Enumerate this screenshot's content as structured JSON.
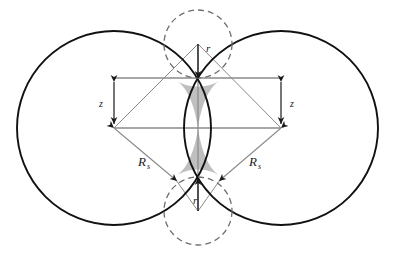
{
  "figure": {
    "background_color": "#ffffff",
    "width": 397,
    "height": 261,
    "colors": {
      "solid_outline": "#111111",
      "dashed_outline": "#6e6e6e",
      "dimension_line": "#8a8a8a",
      "leader_line": "#8a8a8a",
      "neck_fill": "#bfbfbf",
      "label_text": "#1a1a1a"
    },
    "shapes": {
      "left_sphere": {
        "name": "left-sphere",
        "style": "solid",
        "cx": 114,
        "cy": 128,
        "r": 97
      },
      "right_sphere": {
        "name": "right-sphere",
        "style": "solid",
        "cx": 281,
        "cy": 128,
        "r": 97
      },
      "top_meniscus_circle": {
        "name": "top-meniscus-circle",
        "style": "dashed",
        "cx": 198,
        "cy": 44,
        "r": 34
      },
      "bottom_meniscus_circle": {
        "name": "bottom-meniscus-circle",
        "style": "dashed",
        "cx": 198,
        "cy": 211,
        "r": 34
      },
      "neck_region": {
        "name": "neck-region",
        "fill": "#bfbfbf",
        "description": "shaded hourglass liquid bridge between the two spheres"
      }
    },
    "labels": [
      {
        "id": "r_top",
        "text": "r",
        "sub": "",
        "x": 206,
        "y": 50,
        "describes": "meniscus radius, top"
      },
      {
        "id": "r_bottom",
        "text": "r",
        "sub": "",
        "x": 194,
        "y": 202,
        "describes": "meniscus radius, bottom"
      },
      {
        "id": "z_left",
        "text": "z",
        "sub": "",
        "x": 98,
        "y": 106,
        "describes": "half neck height, left"
      },
      {
        "id": "z_right",
        "text": "z",
        "sub": "",
        "x": 290,
        "y": 106,
        "describes": "half neck height, right"
      },
      {
        "id": "Rs_left",
        "text": "R",
        "sub": "s",
        "x": 141,
        "y": 164,
        "describes": "sphere radius, left"
      },
      {
        "id": "Rs_right",
        "text": "R",
        "sub": "s",
        "x": 252,
        "y": 164,
        "describes": "sphere radius, right"
      }
    ],
    "dimensions": [
      {
        "id": "z-left-dimension",
        "type": "vertical-double-arrow",
        "from": [
          114,
          78
        ],
        "to": [
          114,
          128
        ]
      },
      {
        "id": "z-right-dimension",
        "type": "vertical-double-arrow",
        "from": [
          281,
          78
        ],
        "to": [
          281,
          128
        ]
      },
      {
        "id": "r-top-dimension",
        "type": "vertical-arrow-down",
        "from": [
          198,
          44
        ],
        "to": [
          198,
          78
        ]
      },
      {
        "id": "r-bottom-dimension",
        "type": "vertical-arrow-up",
        "from": [
          198,
          211
        ],
        "to": [
          198,
          178
        ]
      },
      {
        "id": "Rs-left-dimension",
        "type": "diagonal-arrow",
        "from": [
          114,
          128
        ],
        "to": [
          176,
          180
        ]
      },
      {
        "id": "Rs-right-dimension",
        "type": "diagonal-arrow",
        "from": [
          281,
          128
        ],
        "to": [
          220,
          180
        ]
      },
      {
        "id": "top-extension-line",
        "type": "horizontal-rule",
        "from": [
          114,
          78
        ],
        "to": [
          281,
          78
        ]
      },
      {
        "id": "center-extension-line",
        "type": "horizontal-rule",
        "from": [
          114,
          128
        ],
        "to": [
          281,
          128
        ]
      },
      {
        "id": "left-to-top-meniscus",
        "type": "diagonal-leader",
        "from": [
          114,
          128
        ],
        "to": [
          198,
          44
        ]
      },
      {
        "id": "right-to-top-meniscus",
        "type": "diagonal-leader",
        "from": [
          281,
          128
        ],
        "to": [
          198,
          44
        ]
      },
      {
        "id": "left-to-bottom-meniscus",
        "type": "diagonal-leader",
        "from": [
          176,
          180
        ],
        "to": [
          198,
          211
        ]
      },
      {
        "id": "right-to-bottom-meniscus",
        "type": "diagonal-leader",
        "from": [
          220,
          180
        ],
        "to": [
          198,
          211
        ]
      }
    ]
  }
}
